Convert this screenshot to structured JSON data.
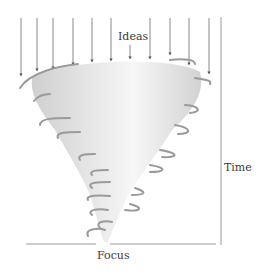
{
  "diagram": {
    "labels": {
      "top": "Ideas",
      "right": "Time",
      "bottom": "Focus"
    },
    "elements": {
      "arrows_count": 11,
      "shape": "tornado funnel",
      "axis_time": "vertical line on right",
      "axis_focus": "horizontal line at bottom"
    },
    "colors": {
      "line": "#9a9a9a",
      "arrow": "#555555",
      "funnel_light": "#e6e6e6",
      "funnel_dark": "#8c8c8c",
      "text": "#3a3a3a"
    }
  }
}
